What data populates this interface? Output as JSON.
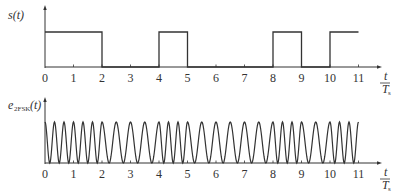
{
  "top_plot": {
    "ylabel": "s(t)",
    "bits": [
      1,
      1,
      0,
      0,
      1,
      0,
      0,
      0,
      1,
      0,
      1
    ],
    "tick_labels": [
      "0",
      "1",
      "2",
      "3",
      "4",
      "5",
      "6",
      "7",
      "8",
      "9",
      "10",
      "11"
    ],
    "xlabel_num": "t",
    "xlabel_den": "T",
    "xlabel_den_sub": "s"
  },
  "bottom_plot": {
    "ylabel_main": "e",
    "ylabel_sub": "2FSK",
    "ylabel_tail": "(t)",
    "cycles_per_bit_for_1": 3,
    "cycles_per_bit_for_0": 2,
    "tick_labels": [
      "0",
      "1",
      "2",
      "3",
      "4",
      "5",
      "6",
      "7",
      "8",
      "9",
      "10",
      "11"
    ],
    "xlabel_num": "t",
    "xlabel_den": "T",
    "xlabel_den_sub": "s"
  },
  "style": {
    "line_color": "#333333",
    "background": "#ffffff"
  }
}
